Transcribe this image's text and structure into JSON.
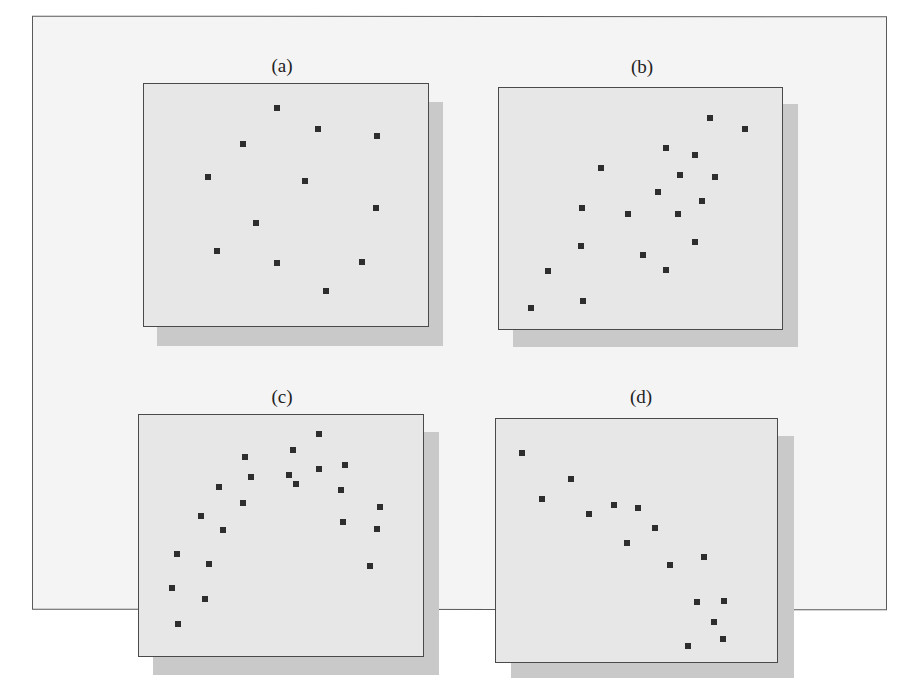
{
  "figure": {
    "colors": {
      "page_bg": "#ffffff",
      "outer_frame_bg": "#f4f4f4",
      "panel_bg": "#e7e7e7",
      "panel_shadow": "#c9c9c9",
      "border": "#4a4a4a",
      "marker": "#2e2e2e"
    }
  },
  "chart_data": [
    {
      "type": "scatter",
      "title": "(a)",
      "description": "no apparent correlation",
      "xlabel": "",
      "ylabel": "",
      "grid": false,
      "xlim": [
        0,
        100
      ],
      "ylim": [
        0,
        100
      ],
      "points": [
        [
          46.7,
          90.2
        ],
        [
          61.4,
          81.6
        ],
        [
          82.1,
          78.7
        ],
        [
          34.7,
          75.4
        ],
        [
          22.5,
          61.5
        ],
        [
          56.8,
          59.8
        ],
        [
          81.8,
          48.8
        ],
        [
          39.6,
          42.6
        ],
        [
          25.6,
          31.1
        ],
        [
          47.0,
          26.2
        ],
        [
          76.8,
          26.6
        ],
        [
          64.2,
          14.3
        ]
      ]
    },
    {
      "type": "scatter",
      "title": "(b)",
      "description": "positive correlation",
      "xlabel": "",
      "ylabel": "",
      "grid": false,
      "xlim": [
        0,
        100
      ],
      "ylim": [
        0,
        100
      ],
      "points": [
        [
          74.4,
          87.7
        ],
        [
          87.0,
          83.1
        ],
        [
          58.9,
          74.9
        ],
        [
          69.1,
          72.4
        ],
        [
          36.1,
          66.7
        ],
        [
          64.1,
          63.8
        ],
        [
          76.5,
          63.0
        ],
        [
          56.1,
          56.8
        ],
        [
          71.6,
          53.1
        ],
        [
          29.5,
          50.2
        ],
        [
          45.6,
          47.7
        ],
        [
          63.2,
          47.7
        ],
        [
          69.1,
          36.2
        ],
        [
          29.1,
          34.6
        ],
        [
          50.9,
          30.9
        ],
        [
          58.9,
          24.3
        ],
        [
          17.2,
          23.9
        ],
        [
          29.8,
          11.5
        ],
        [
          11.2,
          8.6
        ]
      ]
    },
    {
      "type": "scatter",
      "title": "(c)",
      "description": "curvilinear (inverted U) relationship",
      "xlabel": "",
      "ylabel": "",
      "grid": false,
      "xlim": [
        0,
        100
      ],
      "ylim": [
        0,
        100
      ],
      "points": [
        [
          63.3,
          92.2
        ],
        [
          54.2,
          85.6
        ],
        [
          37.4,
          82.7
        ],
        [
          72.4,
          79.4
        ],
        [
          39.5,
          74.1
        ],
        [
          52.8,
          75.3
        ],
        [
          63.3,
          77.8
        ],
        [
          55.3,
          71.2
        ],
        [
          28.3,
          70.0
        ],
        [
          71.0,
          68.7
        ],
        [
          36.7,
          63.4
        ],
        [
          84.9,
          61.7
        ],
        [
          21.7,
          58.0
        ],
        [
          71.7,
          55.6
        ],
        [
          83.9,
          52.7
        ],
        [
          29.7,
          52.3
        ],
        [
          13.3,
          42.4
        ],
        [
          24.5,
          38.3
        ],
        [
          81.5,
          37.4
        ],
        [
          11.5,
          28.4
        ],
        [
          23.1,
          23.5
        ],
        [
          13.6,
          13.2
        ]
      ]
    },
    {
      "type": "scatter",
      "title": "(d)",
      "description": "negative correlation",
      "xlabel": "",
      "ylabel": "",
      "grid": false,
      "xlim": [
        0,
        100
      ],
      "ylim": [
        0,
        100
      ],
      "points": [
        [
          9.1,
          86.1
        ],
        [
          26.7,
          75.5
        ],
        [
          16.5,
          66.9
        ],
        [
          42.1,
          64.5
        ],
        [
          50.5,
          63.3
        ],
        [
          33.0,
          60.8
        ],
        [
          56.5,
          55.1
        ],
        [
          46.7,
          49.0
        ],
        [
          74.0,
          43.3
        ],
        [
          61.8,
          40.0
        ],
        [
          71.6,
          24.5
        ],
        [
          81.1,
          25.3
        ],
        [
          77.5,
          16.3
        ],
        [
          80.7,
          9.4
        ],
        [
          68.4,
          6.5
        ]
      ]
    }
  ]
}
